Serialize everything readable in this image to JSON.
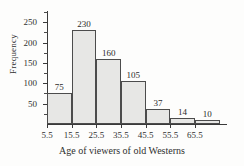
{
  "chart_data": {
    "type": "bar",
    "title": "",
    "xlabel": "Age of viewers of old Westerns",
    "ylabel": "Frequency",
    "categories": [
      "5.5-15.5",
      "15.5-25.5",
      "25.5-35.5",
      "35.5-45.5",
      "45.5-55.5",
      "55.5-65.5",
      "65.5-75.5"
    ],
    "values": [
      75,
      230,
      160,
      105,
      37,
      14,
      10
    ],
    "value_labels": [
      "75",
      "230",
      "160",
      "105",
      "37",
      "14",
      "10"
    ],
    "bin_edges": [
      5.5,
      15.5,
      25.5,
      35.5,
      45.5,
      55.5,
      65.5,
      75.5
    ],
    "xtick_labels": [
      "5.5",
      "15.5",
      "25.5",
      "35.5",
      "45.5",
      "55.5",
      "65.5"
    ],
    "ytick_labels": [
      "50",
      "100",
      "150",
      "200",
      "250"
    ],
    "ytick_values": [
      50,
      100,
      150,
      200,
      250
    ],
    "yminor_values": [
      25,
      75,
      125,
      175,
      225,
      275
    ],
    "ylim": [
      0,
      280
    ],
    "xlim": [
      5.5,
      78.5
    ],
    "grid": false,
    "legend": false,
    "bar_fill_color": "#e7e7e5",
    "bar_border_color": "#4c4c4c",
    "axis_color": "#3a3a3a",
    "text_color": "#2b2b2b",
    "background_color": "#fdfdfc"
  }
}
